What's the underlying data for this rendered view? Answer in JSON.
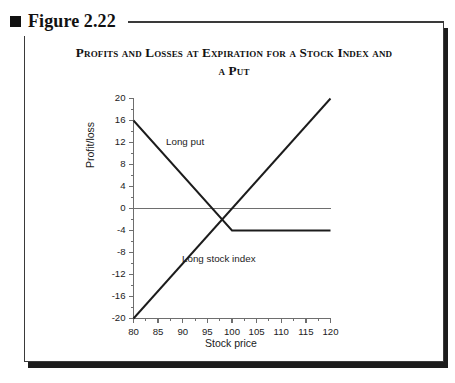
{
  "figure": {
    "bullet_icon": "square-bullet-icon",
    "label": "Figure 2.22"
  },
  "title": {
    "line1": "Profits and Losses at Expiration for a Stock Index and",
    "line2": "a Put"
  },
  "chart_data": {
    "type": "line",
    "title": "Profits and Losses at Expiration for a Stock Index and a Put",
    "xlabel": "Stock price",
    "ylabel": "Profit/loss",
    "xlim": [
      80,
      120
    ],
    "ylim": [
      -20,
      20
    ],
    "xticks": [
      80,
      85,
      90,
      95,
      100,
      105,
      110,
      115,
      120
    ],
    "yticks": [
      20,
      16,
      12,
      8,
      4,
      0,
      -4,
      -8,
      -12,
      -16,
      -20
    ],
    "xtick_labels": [
      "80",
      "85",
      "90",
      "95",
      "100",
      "105",
      "110",
      "115",
      "120"
    ],
    "ytick_labels": [
      "20",
      "16",
      "12",
      "8",
      "4",
      "0",
      "-4",
      "-8",
      "-12",
      "-16",
      "-20"
    ],
    "xtick_minor_step": 2.5,
    "ytick_minor_step": 2,
    "grid": false,
    "legend": "inline-annotations",
    "zero_line": 0,
    "series": [
      {
        "name": "Long put",
        "label_x": 90,
        "label_y": 12,
        "x": [
          80,
          100,
          120
        ],
        "y": [
          16,
          -4,
          -4
        ]
      },
      {
        "name": "Long stock index",
        "label_x": 96,
        "label_y": -10,
        "x": [
          80,
          120
        ],
        "y": [
          -20,
          20
        ]
      }
    ],
    "annotations": [
      {
        "text": "Long put",
        "x": 90,
        "y": 12
      },
      {
        "text": "Long stock index",
        "x": 96,
        "y": -10
      }
    ],
    "colors": {
      "line": "#1c1c1c",
      "axis": "#6e6e6e",
      "zero_line": "#6e6e6e",
      "text": "#1b1b1b"
    }
  }
}
